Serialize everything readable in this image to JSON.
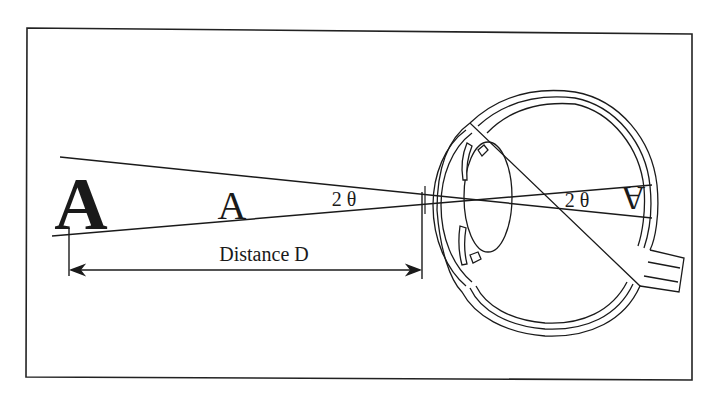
{
  "figure": {
    "type": "visual-angle-diagram",
    "labels": {
      "large_object": "A",
      "small_object": "A",
      "object_angle": "2 θ",
      "retinal_angle": "2 θ",
      "retinal_image": "A",
      "distance": "Distance D"
    },
    "colors": {
      "line": "#1a1a1a",
      "background": "#ffffff",
      "frame": "#222222"
    },
    "parts": [
      "frame",
      "large-object",
      "small-object",
      "ray-top",
      "ray-bottom",
      "distance-arrow",
      "eye-cross-section",
      "cornea",
      "lens",
      "iris",
      "retina",
      "optic-nerve",
      "retinal-image"
    ]
  }
}
